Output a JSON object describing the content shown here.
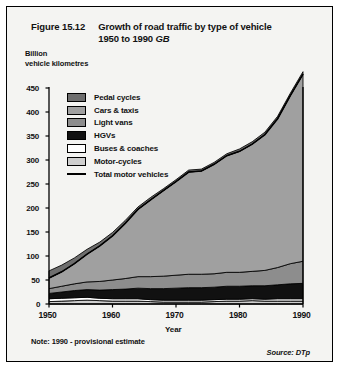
{
  "figure": {
    "number": "Figure 15.12",
    "title_line1": "Growth of road traffic by type of vehicle",
    "title_line2": "1950 to 1990",
    "title_region": "GB",
    "note": "Note:  1990 - provisional estimate",
    "source": "Source:  DTp"
  },
  "axis": {
    "y_caption_line1": "Billion",
    "y_caption_line2": "vehicle kilometres",
    "x_title": "Year"
  },
  "legend": [
    {
      "label": "Pedal cycles",
      "color": "#6e6e6e",
      "type": "swatch"
    },
    {
      "label": "Cars & taxis",
      "color": "#a0a0a0",
      "type": "swatch"
    },
    {
      "label": "Light vans",
      "color": "#8d8d8d",
      "type": "swatch"
    },
    {
      "label": "HGVs",
      "color": "#111111",
      "type": "swatch"
    },
    {
      "label": "Buses & coaches",
      "color": "#ffffff",
      "type": "swatch"
    },
    {
      "label": "Motor-cycles",
      "color": "#cfcfcf",
      "type": "swatch"
    },
    {
      "label": "Total motor vehicles",
      "color": "#000000",
      "type": "line"
    }
  ],
  "chart_data": {
    "type": "area",
    "title": "Growth of road traffic by type of vehicle 1950 to 1990 GB",
    "xlabel": "Year",
    "ylabel": "Billion vehicle kilometres",
    "xlim": [
      1950,
      1990
    ],
    "ylim": [
      0,
      450
    ],
    "ytick_labels": [
      "0",
      "50",
      "100",
      "150",
      "200",
      "250",
      "300",
      "350",
      "400",
      "450"
    ],
    "yticks": [
      0,
      50,
      100,
      150,
      200,
      250,
      300,
      350,
      400,
      450
    ],
    "xtick_labels": [
      "1950",
      "1960",
      "1970",
      "1980",
      "1990"
    ],
    "xticks": [
      1950,
      1960,
      1970,
      1980,
      1990
    ],
    "grid": false,
    "legend_position": "inside-top-left",
    "stacked": true,
    "stack_order_bottom_to_top": [
      "Motor-cycles",
      "Buses & coaches",
      "HGVs",
      "Light vans",
      "Cars & taxis",
      "Pedal cycles"
    ],
    "x": [
      1950,
      1952,
      1954,
      1956,
      1958,
      1960,
      1962,
      1964,
      1966,
      1968,
      1970,
      1972,
      1974,
      1976,
      1978,
      1980,
      1982,
      1984,
      1986,
      1988,
      1990
    ],
    "series": [
      {
        "name": "Motor-cycles",
        "values": [
          5,
          6,
          7,
          8,
          7,
          6,
          6,
          6,
          5,
          4,
          4,
          4,
          4,
          5,
          6,
          6,
          7,
          6,
          6,
          6,
          6
        ]
      },
      {
        "name": "Buses & coaches",
        "values": [
          6,
          6,
          6,
          6,
          5,
          5,
          5,
          5,
          4,
          4,
          4,
          4,
          4,
          4,
          4,
          4,
          4,
          4,
          5,
          5,
          5
        ]
      },
      {
        "name": "HGVs",
        "values": [
          11,
          13,
          15,
          16,
          17,
          19,
          20,
          22,
          23,
          24,
          25,
          26,
          26,
          26,
          27,
          27,
          27,
          28,
          29,
          31,
          32
        ]
      },
      {
        "name": "Light vans",
        "values": [
          10,
          12,
          14,
          16,
          18,
          20,
          22,
          24,
          25,
          26,
          27,
          28,
          28,
          28,
          29,
          29,
          30,
          32,
          36,
          42,
          46
        ]
      },
      {
        "name": "Cars & taxis",
        "values": [
          22,
          30,
          42,
          58,
          74,
          92,
          115,
          140,
          160,
          178,
          195,
          213,
          215,
          228,
          243,
          252,
          265,
          283,
          310,
          350,
          390
        ]
      },
      {
        "name": "Pedal cycles",
        "values": [
          15,
          14,
          12,
          10,
          8,
          7,
          6,
          5,
          5,
          4,
          4,
          4,
          4,
          4,
          4,
          5,
          5,
          5,
          5,
          5,
          5
        ]
      }
    ],
    "total_motor_vehicles": [
      54,
      67,
      84,
      104,
      121,
      142,
      168,
      197,
      217,
      236,
      255,
      275,
      277,
      291,
      309,
      318,
      333,
      353,
      386,
      434,
      479
    ],
    "annotations": []
  }
}
